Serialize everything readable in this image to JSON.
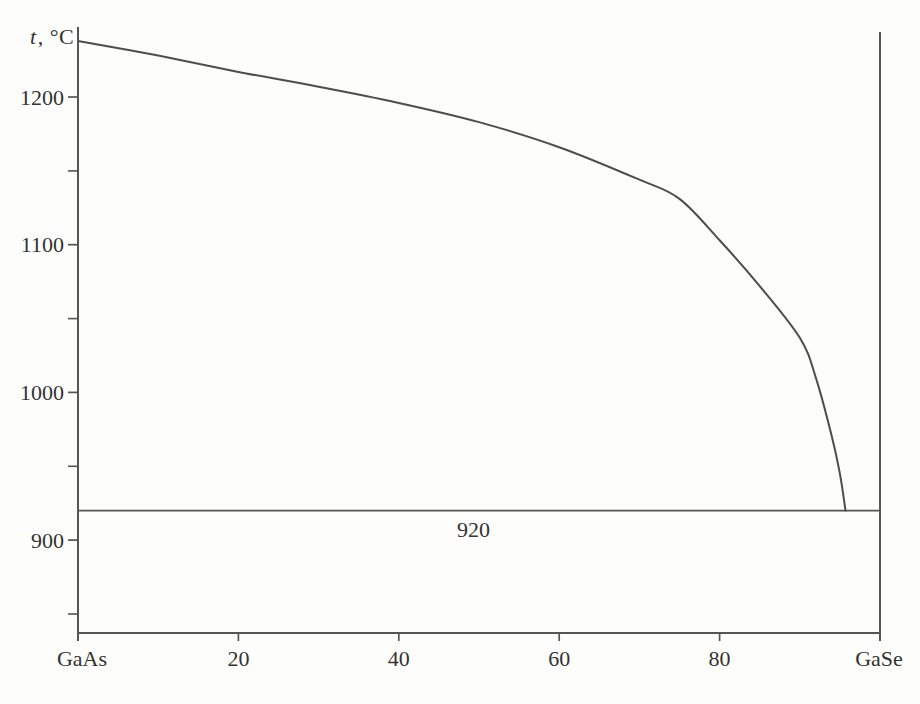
{
  "figure": {
    "y_axis_title": {
      "symbol": "t",
      "unit": ", °C"
    },
    "colors": {
      "line": "#555555",
      "text": "#333333",
      "background": "#fdfdfb"
    }
  },
  "chart_data": {
    "type": "line",
    "title": "",
    "xlabel_left": "GaAs",
    "xlabel_right": "GaSe",
    "ylabel": "t, °C",
    "xlim": [
      0,
      100
    ],
    "ylim": [
      837,
      1249
    ],
    "grid": false,
    "legend": null,
    "x_ticks": [
      20,
      40,
      60,
      80
    ],
    "y_major_ticks": [
      1200,
      1100,
      1000,
      900
    ],
    "y_minor_ticks": [
      1150,
      1050,
      950,
      850
    ],
    "series": [
      {
        "name": "liquidus",
        "points": [
          [
            0,
            1238
          ],
          [
            10,
            1228
          ],
          [
            20,
            1217
          ],
          [
            30,
            1207
          ],
          [
            40,
            1196
          ],
          [
            50,
            1183
          ],
          [
            60,
            1166
          ],
          [
            70,
            1144
          ],
          [
            75,
            1131
          ],
          [
            80,
            1103
          ],
          [
            85,
            1072
          ],
          [
            90,
            1037
          ],
          [
            92,
            1010
          ],
          [
            94,
            970
          ],
          [
            95,
            945
          ],
          [
            95.7,
            920
          ]
        ]
      }
    ],
    "eutectic_line": {
      "temperature": 920,
      "label": "920",
      "label_x": 49.3,
      "x_start": 0,
      "x_end": 100
    }
  }
}
